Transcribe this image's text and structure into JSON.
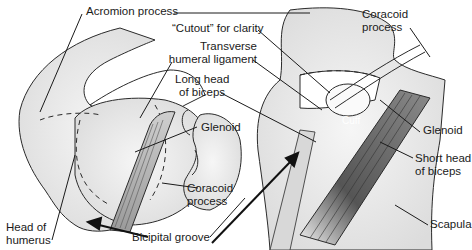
{
  "figure": {
    "labels": {
      "acromion": "Acromion process",
      "cutout": "“Cutout” for clarity",
      "transverse_1": "Transverse",
      "transverse_2": "humeral ligament",
      "longhead_1": "Long head",
      "longhead_2": "of biceps",
      "glenoid_left": "Glenoid",
      "coracoid_left_1": "Coracoid",
      "coracoid_left_2": "process",
      "head_1": "Head of",
      "head_2": "humerus",
      "bicipital": "Bicipital groove",
      "coracoid_right_1": "Coracoid",
      "coracoid_right_2": "process",
      "cuff": "Cuff",
      "glenoid_right": "Glenoid",
      "shorthead_1": "Short head",
      "shorthead_2": "of biceps",
      "scapula": "Scapula"
    },
    "colors": {
      "bone_fill": "#e8e8e8",
      "line": "#2a2a2a",
      "tendon_dark": "#555555"
    }
  }
}
